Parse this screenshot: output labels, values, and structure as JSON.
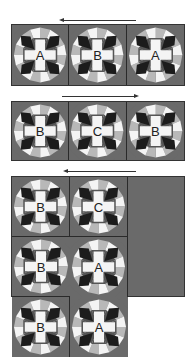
{
  "colors": {
    "background": "#6a6a6a",
    "dark": "#1c1c1c",
    "mid": "#555555",
    "light": "#b8b8b8",
    "white": "#f4f4f4",
    "border": "#2a2a2a",
    "arrow": "#333333"
  },
  "rows": [
    {
      "arrow_direction": "left",
      "blocks": [
        {
          "label": "A"
        },
        {
          "label": "B"
        },
        {
          "label": "A"
        }
      ]
    },
    {
      "arrow_direction": "right",
      "blocks": [
        {
          "label": "B"
        },
        {
          "label": "C"
        },
        {
          "label": "B"
        }
      ]
    },
    {
      "arrow_direction": "left",
      "blocks": [
        {
          "label": "B"
        },
        {
          "label": "C"
        },
        {
          "label": "B"
        }
      ]
    },
    {
      "arrow_direction": "none",
      "blocks": [
        {
          "label": "A"
        },
        {
          "label": "B"
        },
        {
          "label": "A"
        }
      ]
    }
  ]
}
